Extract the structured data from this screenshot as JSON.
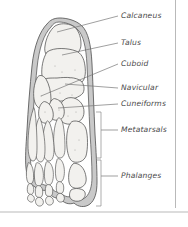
{
  "figure": {
    "background_color": "#ffffff",
    "frame_color": "#b9b9b9",
    "soft_tissue_color": "#c9c9c9",
    "bone_fill_color": "#f2f1ee",
    "bone_outline_color": "#4f4f4f",
    "label_color": "#4a4a4a",
    "leader_color": "#777777"
  },
  "labels": [
    {
      "id": "calcaneus",
      "text": "Calcaneus",
      "x": 121,
      "y": 18
    },
    {
      "id": "talus",
      "text": "Talus",
      "x": 121,
      "y": 45
    },
    {
      "id": "cuboid",
      "text": "Cuboid",
      "x": 121,
      "y": 66
    },
    {
      "id": "navicular",
      "text": "Navicular",
      "x": 121,
      "y": 90
    },
    {
      "id": "cuneiforms",
      "text": "Cuneiforms",
      "x": 121,
      "y": 106
    },
    {
      "id": "metatarsals",
      "text": "Metatarsals",
      "x": 121,
      "y": 132
    },
    {
      "id": "phalanges",
      "text": "Phalanges",
      "x": 121,
      "y": 178
    }
  ],
  "brackets": [
    {
      "id": "metatarsals-bracket",
      "top": 112,
      "bottom": 158,
      "x": 100
    },
    {
      "id": "phalanges-bracket",
      "top": 160,
      "bottom": 206,
      "x": 100
    }
  ]
}
